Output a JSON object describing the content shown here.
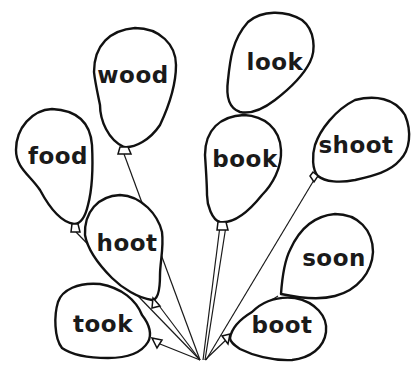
{
  "colors": {
    "ink": "#111111",
    "background": "#ffffff"
  },
  "balloons": [
    {
      "id": "wood",
      "word": "wood",
      "cx": 133,
      "cy": 75
    },
    {
      "id": "look",
      "word": "look",
      "cx": 275,
      "cy": 62
    },
    {
      "id": "food",
      "word": "food",
      "cx": 58,
      "cy": 156
    },
    {
      "id": "book",
      "word": "book",
      "cx": 245,
      "cy": 159
    },
    {
      "id": "shoot",
      "word": "shoot",
      "cx": 356,
      "cy": 145
    },
    {
      "id": "hoot",
      "word": "hoot",
      "cx": 127,
      "cy": 243
    },
    {
      "id": "soon",
      "word": "soon",
      "cx": 334,
      "cy": 258
    },
    {
      "id": "took",
      "word": "took",
      "cx": 103,
      "cy": 324
    },
    {
      "id": "boot",
      "word": "boot",
      "cx": 282,
      "cy": 325
    }
  ]
}
